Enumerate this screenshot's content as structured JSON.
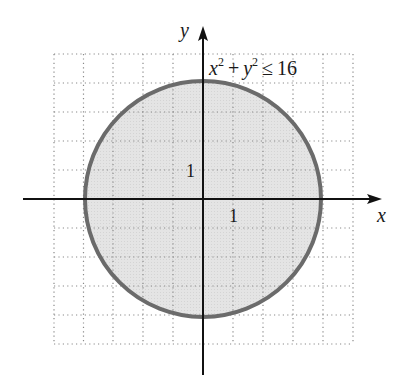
{
  "figure": {
    "inequality": {
      "base_x": "x",
      "exp_x": "2",
      "plus": "+",
      "base_y": "y",
      "exp_y": "2",
      "rel": "≤",
      "rhs": "16"
    },
    "x_axis_label": "x",
    "y_axis_label": "y",
    "x_tick_label": "1",
    "y_tick_label": "1",
    "grid": {
      "x_min": -5,
      "x_max": 5,
      "y_min": -5,
      "y_max": 5,
      "step": 1
    },
    "circle": {
      "radius": 4,
      "fill": "#e2e2e2",
      "stroke": "#6b6b6b"
    }
  }
}
